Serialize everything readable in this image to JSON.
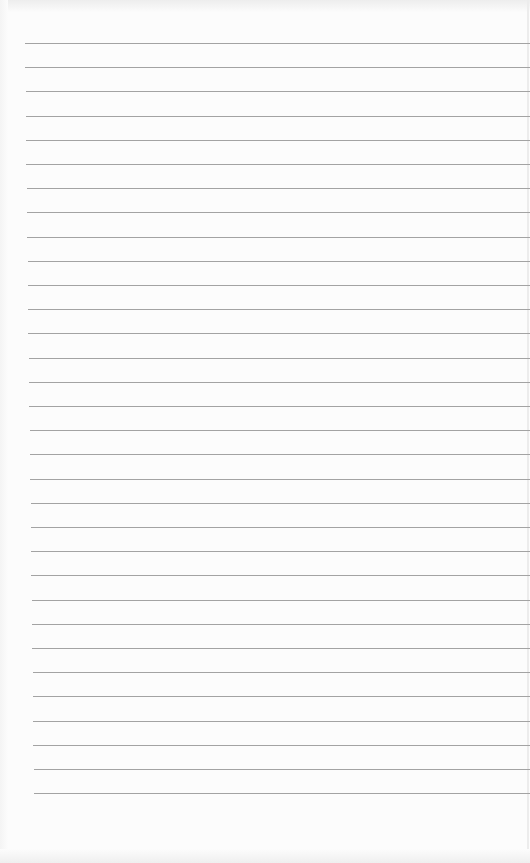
{
  "document": {
    "type": "lined-notebook-page",
    "text": "",
    "colors": {
      "paper": "#fcfcfc",
      "rule_line": "#a3a3a3",
      "edge_shade": "#ededed"
    },
    "rules": {
      "count": 32,
      "first_y": 43,
      "spacing": 24.2,
      "left_start_top": 25,
      "left_start_bottom": 34,
      "right_end": 530
    }
  }
}
